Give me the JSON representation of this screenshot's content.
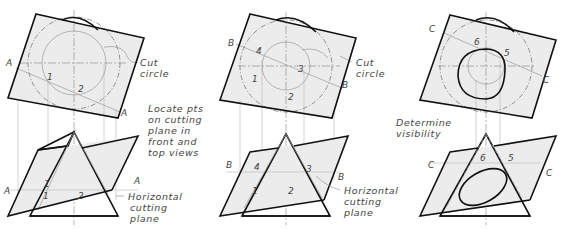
{
  "title": "",
  "views": [
    {
      "id": "A",
      "plane_letter": "A",
      "points_top": [
        "1",
        "2"
      ],
      "points_front": [
        "1",
        "1",
        "2"
      ],
      "notes": {
        "cut_circle": [
          "Cut",
          "circle"
        ],
        "step": [
          "Locate pts",
          "on cutting",
          "plane in",
          "front and",
          "top views"
        ],
        "horizontal": [
          "Horizontal",
          "cutting",
          "plane"
        ]
      }
    },
    {
      "id": "B",
      "plane_letter": "B",
      "points_top": [
        "4",
        "3",
        "1",
        "2"
      ],
      "points_front": [
        "4",
        "3",
        "1",
        "2"
      ],
      "notes": {
        "cut_circle": [
          "Cut",
          "circle"
        ],
        "horizontal": [
          "Horizontal",
          "cutting",
          "plane"
        ]
      }
    },
    {
      "id": "C",
      "plane_letter": "C",
      "points_top": [
        "6",
        "5"
      ],
      "points_front": [
        "6",
        "5"
      ],
      "notes": {
        "step": [
          "Determine",
          "visibility"
        ]
      }
    }
  ],
  "colors": {
    "plane_fill": "#ececec",
    "outline": "#111111",
    "construction": "#999999",
    "text": "#444444"
  }
}
